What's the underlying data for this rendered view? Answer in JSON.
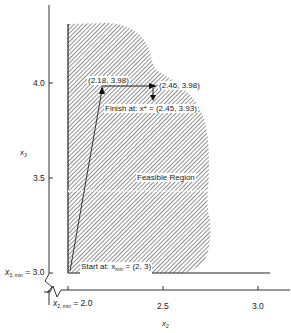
{
  "diagram": {
    "x_axis": {
      "label": "x₂",
      "ticks": [
        "2.0",
        "2.5",
        "3.0"
      ],
      "min_label": "x₂, min = 2.0"
    },
    "y_axis": {
      "label": "x₃",
      "ticks": [
        "3.0",
        "3.5",
        "4.0"
      ],
      "min_label": "x₃, min = 3.0"
    },
    "region_label": "Feasible Region",
    "points": [
      {
        "label": "(2.18, 3.98)",
        "x": 2.18,
        "y": 3.98
      },
      {
        "label": "(2.46, 3.98)",
        "x": 2.46,
        "y": 3.98
      },
      {
        "label": "Finish at: x* = (2.45, 3.93)",
        "x": 2.45,
        "y": 3.93
      },
      {
        "label": "Start at: x_min = (2, 3)",
        "x": 2.0,
        "y": 3.0
      }
    ],
    "labels": {
      "p1": "(2.18, 3.98)",
      "p2": "(2.46, 3.98)",
      "finish": "Finish at: x* = (2.45, 3.93)",
      "start_prefix": "Start at: x",
      "start_sub": "min",
      "start_suffix": " = (2, 3)",
      "x_min_prefix": "x",
      "x_min_sub": "2, min",
      "x_min_suffix": " = 2.0",
      "y_min_prefix": "x",
      "y_min_sub": "3, min",
      "y_min_suffix": " = 3.0",
      "x_axis_title": "x",
      "x_axis_sub": "2",
      "y_axis_title": "x",
      "y_axis_sub": "3",
      "tick_x_25": "2.5",
      "tick_x_30": "3.0",
      "tick_y_35": "3.5",
      "tick_y_40": "4.0"
    },
    "path": [
      [
        2.0,
        3.0
      ],
      [
        2.18,
        3.98
      ],
      [
        2.46,
        3.98
      ],
      [
        2.45,
        3.93
      ]
    ]
  }
}
